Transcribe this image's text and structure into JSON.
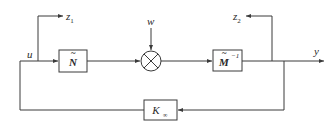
{
  "diagram": {
    "type": "block-diagram",
    "blocks": [
      {
        "id": "N",
        "label": "Ñ",
        "base": "N",
        "accent": "~"
      },
      {
        "id": "Minv",
        "label": "M̃⁻¹",
        "base": "M",
        "accent": "~",
        "sup": "−1"
      },
      {
        "id": "K",
        "label": "K∞",
        "base": "K",
        "sub": "∞"
      }
    ],
    "summing_junction": {
      "id": "sum",
      "symbol": "⊗"
    },
    "signals": {
      "u": "u",
      "w": "w",
      "z1": {
        "base": "z",
        "sub": "1"
      },
      "z2": {
        "base": "z",
        "sub": "2"
      },
      "y": "y"
    },
    "colors": {
      "line": "#3a3a3a",
      "text": "#2a2a2a",
      "background": "#ffffff"
    }
  }
}
